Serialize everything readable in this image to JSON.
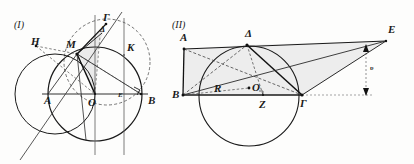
{
  "figure": {
    "title_visible": false,
    "background_color": "#fdfdfc",
    "stroke_color": "#1a1a1a",
    "fill_color": "#e9e9e9",
    "panels": [
      {
        "id": "panel-1",
        "number_label": "(I)",
        "points": [
          {
            "name": "H",
            "label": "H",
            "x": 31,
            "y": 42
          },
          {
            "name": "M",
            "label": "M",
            "x": 78,
            "y": 44
          },
          {
            "name": "Gamma",
            "label": "Γ",
            "x": 111,
            "y": 19
          },
          {
            "name": "Delta",
            "label": "Δ",
            "x": 97,
            "y": 31
          },
          {
            "name": "K",
            "label": "K",
            "x": 127,
            "y": 47
          },
          {
            "name": "A",
            "label": "A",
            "x": 46,
            "y": 101
          },
          {
            "name": "O",
            "label": "O",
            "x": 90,
            "y": 104
          },
          {
            "name": "B",
            "label": "B",
            "x": 150,
            "y": 102
          },
          {
            "name": "E",
            "label": "E",
            "x": 118,
            "y": 99
          }
        ]
      },
      {
        "id": "panel-2",
        "number_label": "(II)",
        "points": [
          {
            "name": "A",
            "label": "A",
            "x": 216,
            "y": 34
          },
          {
            "name": "Delta",
            "label": "Δ",
            "x": 292,
            "y": 34
          },
          {
            "name": "E",
            "label": "E",
            "x": 392,
            "y": 30
          },
          {
            "name": "B",
            "label": "B",
            "x": 176,
            "y": 96
          },
          {
            "name": "R",
            "label": "R",
            "x": 235,
            "y": 90
          },
          {
            "name": "O",
            "label": "O",
            "x": 254,
            "y": 90
          },
          {
            "name": "Z",
            "label": "Z",
            "x": 264,
            "y": 105
          },
          {
            "name": "Gamma",
            "label": "Γ",
            "x": 305,
            "y": 104
          },
          {
            "name": "upsilon",
            "label": "υ",
            "x": 369,
            "y": 77
          }
        ]
      }
    ]
  }
}
